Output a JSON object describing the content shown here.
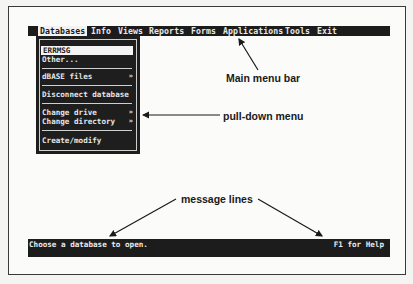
{
  "menubar": {
    "items": [
      {
        "label": "Databases",
        "active": true
      },
      {
        "label": "Info"
      },
      {
        "label": "Views"
      },
      {
        "label": "Reports"
      },
      {
        "label": "Forms"
      },
      {
        "label": "Applications"
      },
      {
        "label": "Tools"
      },
      {
        "label": "Exit"
      }
    ]
  },
  "dropdown": {
    "items": [
      {
        "label": "ERRMSG",
        "selected": true
      },
      {
        "label": "Other..."
      },
      {
        "label": "dBASE files",
        "submenu_indicator": "»"
      },
      {
        "label": "Disconnect database"
      },
      {
        "label": "Change drive",
        "submenu_indicator": "»"
      },
      {
        "label": "Change directory",
        "submenu_indicator": "»"
      },
      {
        "label": "Create/modify"
      }
    ]
  },
  "annotations": {
    "main_menu_bar": "Main menu bar",
    "pull_down_menu": "pull-down menu",
    "message_lines": "message lines"
  },
  "statusbar": {
    "message": "Choose a database to open.",
    "help": "F1 for Help"
  },
  "colors": {
    "bar_bg": "#1c1c1c",
    "bar_text": "#e8e8e8",
    "highlight_bg": "#f2f2f2",
    "page_bg": "#fbfbfa"
  }
}
